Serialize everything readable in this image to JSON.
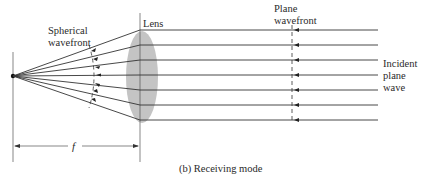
{
  "labels": {
    "lens": "Lens",
    "spherical_wavefront_line1": "Spherical",
    "spherical_wavefront_line2": "wavefront",
    "plane_wavefront_line1": "Plane",
    "plane_wavefront_line2": "wavefront",
    "incident_line1": "Incident",
    "incident_line2": "plane",
    "incident_line3": "wave",
    "focal_length": "f",
    "caption": "(b)  Receiving mode"
  },
  "colors": {
    "lens_fill": "#c4c4c4",
    "line": "#333333",
    "background": "#ffffff"
  },
  "geometry": {
    "focal_point": [
      13,
      76
    ],
    "lens_x": 140,
    "plane_wavefront_x": 293,
    "ray_end_x": 378,
    "ray_y_at_lens": [
      30,
      45,
      60,
      75,
      90,
      105,
      120
    ]
  }
}
